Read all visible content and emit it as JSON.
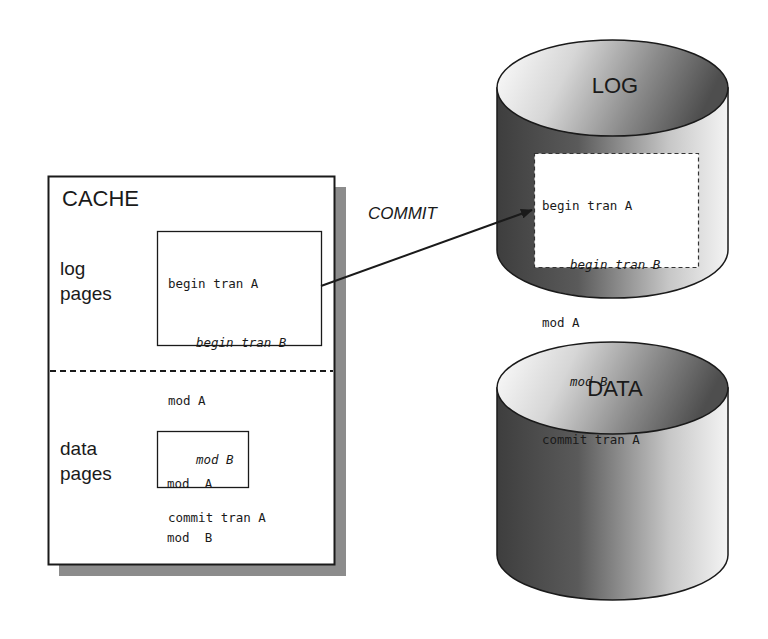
{
  "cache": {
    "title": "CACHE",
    "log_section": {
      "label_line1": "log",
      "label_line2": "pages",
      "records": [
        {
          "text": "begin tran A",
          "indent": false
        },
        {
          "text": "begin tran B",
          "indent": true
        },
        {
          "text": "mod A",
          "indent": false
        },
        {
          "text": "mod B",
          "indent": true
        },
        {
          "text": "commit tran A",
          "indent": false
        }
      ]
    },
    "data_section": {
      "label_line1": "data",
      "label_line2": "pages",
      "records": [
        {
          "text": "mod  A"
        },
        {
          "text": "mod  B"
        }
      ]
    }
  },
  "arrow": {
    "label": "COMMIT"
  },
  "log_disk": {
    "label": "LOG",
    "records": [
      {
        "text": "begin tran A",
        "indent": false
      },
      {
        "text": "begin tran B",
        "indent": true
      },
      {
        "text": "mod A",
        "indent": false
      },
      {
        "text": "mod B",
        "indent": true
      },
      {
        "text": "commit tran A",
        "indent": false
      }
    ]
  },
  "data_disk": {
    "label": "DATA"
  },
  "colors": {
    "ink": "#1a1a1a",
    "shadow": "#8c8c8c",
    "cylinder_dark": "#4a4a4a",
    "cylinder_light": "#f2f2f2"
  }
}
